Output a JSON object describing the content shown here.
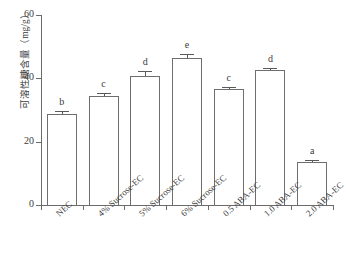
{
  "chart_data": {
    "type": "bar",
    "title": "",
    "xlabel": "",
    "ylabel": "可溶性糖含量（mg/g）",
    "ylim": [
      0,
      60
    ],
    "yticks": [
      0,
      20,
      40,
      60
    ],
    "grid": false,
    "legend": null,
    "categories": [
      "NEC",
      "4% Sucrose-EC",
      "5% Sucrose-EC",
      "6% Sucrose-EC",
      "0.5 ABA-EC",
      "1.0 ABA-EC",
      "2.0 ABA-EC"
    ],
    "values": [
      28.8,
      34.3,
      40.8,
      46.3,
      36.5,
      42.5,
      13.5
    ],
    "errors": [
      0.9,
      1.1,
      1.4,
      1.4,
      0.9,
      0.7,
      0.6
    ],
    "annotations": [
      "b",
      "c",
      "d",
      "e",
      "c",
      "d",
      "a"
    ]
  }
}
